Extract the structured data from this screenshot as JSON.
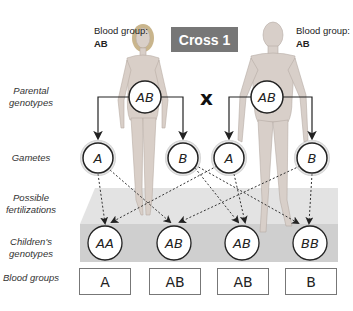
{
  "title": "Cross 1",
  "cross_symbol": "x",
  "parents": [
    {
      "figure": "female",
      "caption_prefix": "Blood group: ",
      "blood_group": "AB",
      "genotype": "AB"
    },
    {
      "figure": "male",
      "caption_prefix": "Blood group: ",
      "blood_group": "AB",
      "genotype": "AB"
    }
  ],
  "row_labels": {
    "parental_genotypes": "Parental genotypes",
    "gametes": "Gametes",
    "possible_fertilizations": "Possible fertilizations",
    "childrens_genotypes": "Children's genotypes",
    "blood_groups": "Blood groups"
  },
  "gametes": [
    "A",
    "B",
    "A",
    "B"
  ],
  "children_genotypes": [
    "AA",
    "AB",
    "AB",
    "BB"
  ],
  "children_blood_groups": [
    "A",
    "AB",
    "AB",
    "B"
  ],
  "fertilization_arrows": [
    {
      "from_gamete": 0,
      "to_child": 0
    },
    {
      "from_gamete": 0,
      "to_child": 1
    },
    {
      "from_gamete": 1,
      "to_child": 2
    },
    {
      "from_gamete": 1,
      "to_child": 3
    },
    {
      "from_gamete": 2,
      "to_child": 0
    },
    {
      "from_gamete": 2,
      "to_child": 2
    },
    {
      "from_gamete": 3,
      "to_child": 1
    },
    {
      "from_gamete": 3,
      "to_child": 3
    }
  ],
  "colors": {
    "title_bg": "#777777",
    "platform": "#d6d6d6",
    "platform_band": "#c8c8c8"
  }
}
